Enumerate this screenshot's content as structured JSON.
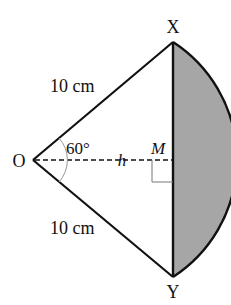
{
  "diagram": {
    "type": "circle-sector-segment",
    "points": {
      "O": {
        "label": "O"
      },
      "X": {
        "label": "X"
      },
      "Y": {
        "label": "Y"
      },
      "M": {
        "label": "M"
      }
    },
    "labels": {
      "radius_top": "10 cm",
      "radius_bottom": "10 cm",
      "angle": "60°",
      "height": "h"
    },
    "colors": {
      "segment_fill": "#a6a6a6",
      "stroke": "#111111",
      "angle_arc": "#999999"
    }
  }
}
